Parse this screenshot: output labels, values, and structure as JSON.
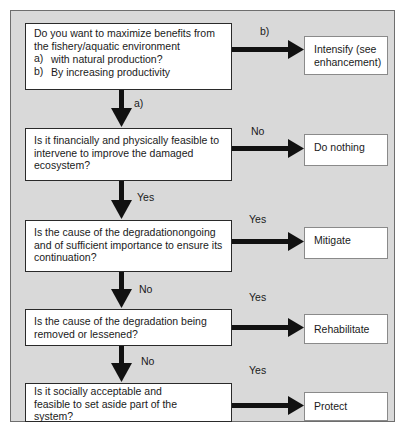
{
  "questions": [
    {
      "intro": [
        "Do you want to maximize benefits  from",
        "the fishery/aquatic environment"
      ],
      "options": [
        {
          "marker": "a)",
          "text": "with natural production?"
        },
        {
          "marker": "b)",
          "text": "By increasing productivity"
        }
      ]
    },
    {
      "lines": [
        "Is it financially and physically feasible  to",
        "intervene to improve the damaged",
        "ecosystem?"
      ]
    },
    {
      "lines": [
        "Is the cause of the degradationongoing",
        "and of sufficient importance to ensure its",
        "continuation?"
      ]
    },
    {
      "lines": [
        "Is the cause of the degradation being",
        "removed or lessened?"
      ]
    },
    {
      "lines": [
        "Is it socially acceptable and",
        "feasible to set aside part of the",
        "system?"
      ]
    }
  ],
  "outcomes": [
    {
      "lines": [
        "Intensify (see",
        "enhancement)"
      ]
    },
    {
      "lines": [
        "Do nothing"
      ]
    },
    {
      "lines": [
        "Mitigate"
      ]
    },
    {
      "lines": [
        "Rehabilitate"
      ]
    },
    {
      "lines": [
        "Protect"
      ]
    }
  ],
  "branch_labels": {
    "q1_right": "b)",
    "q1_down": "a)",
    "q2_right": "No",
    "q2_down": "Yes",
    "q3_right": "Yes",
    "q3_down": "No",
    "q4_right": "Yes",
    "q4_down": "No",
    "q5_right": "Yes"
  },
  "colors": {
    "frame_fill": "#d9d9d9",
    "box_fill": "#ffffff",
    "arrow": "#111111"
  }
}
